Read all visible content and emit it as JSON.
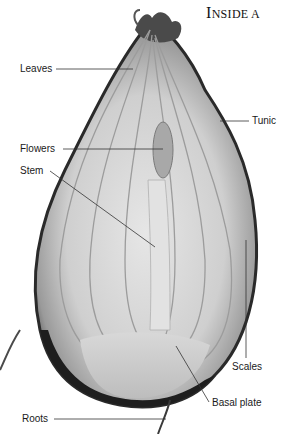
{
  "page": {
    "heading": "INSIDE A",
    "heading_first": "I",
    "heading_rest": "NSIDE A"
  },
  "figure": {
    "colors": {
      "background": "#ffffff",
      "flesh": "#d9d9d9",
      "dark_skin": "#2a2a2a",
      "leader_line": "#333333",
      "text": "#1a1a1a"
    }
  },
  "labels": [
    {
      "id": "leaves",
      "text": "Leaves",
      "x": 20,
      "y": 63
    },
    {
      "id": "tunic",
      "text": "Tunic",
      "x": 252,
      "y": 116
    },
    {
      "id": "flowers",
      "text": "Flowers",
      "x": 20,
      "y": 143
    },
    {
      "id": "stem",
      "text": "Stem",
      "x": 20,
      "y": 165
    },
    {
      "id": "scales",
      "text": "Scales",
      "x": 232,
      "y": 362
    },
    {
      "id": "basal_plate",
      "text": "Basal plate",
      "x": 212,
      "y": 398
    },
    {
      "id": "roots",
      "text": "Roots",
      "x": 22,
      "y": 415
    }
  ]
}
